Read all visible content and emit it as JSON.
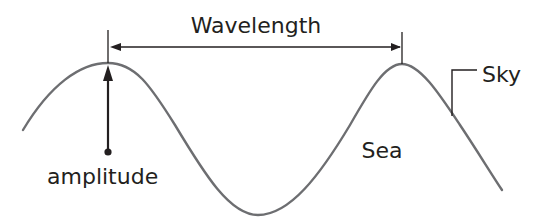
{
  "diagram": {
    "labels": {
      "wavelength": "Wavelength",
      "amplitude": "amplitude",
      "sky": "Sky",
      "sea": "Sea"
    },
    "colors": {
      "wave": "#6d6e71",
      "annotation": "#231f20",
      "background": "#ffffff"
    }
  }
}
